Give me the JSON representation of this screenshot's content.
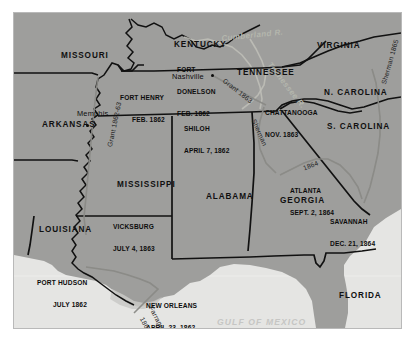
{
  "figure": {
    "kind": "historical-map",
    "frame_color": "#b9b9b9",
    "land_color": "#9e9e9c",
    "water_color": "#e3e3e1",
    "border_ink": "#111111"
  },
  "states": [
    {
      "name": "MISSOURI",
      "x": 47,
      "y": 38
    },
    {
      "name": "KENTUCKY",
      "x": 160,
      "y": 27
    },
    {
      "name": "VIRGINIA",
      "x": 303,
      "y": 28
    },
    {
      "name": "TENNESSEE",
      "x": 223,
      "y": 55
    },
    {
      "name": "N. CAROLINA",
      "x": 310,
      "y": 75
    },
    {
      "name": "S. CAROLINA",
      "x": 313,
      "y": 109
    },
    {
      "name": "ARKANSAS",
      "x": 28,
      "y": 107
    },
    {
      "name": "MISSISSIPPI",
      "x": 103,
      "y": 167
    },
    {
      "name": "ALABAMA",
      "x": 192,
      "y": 179
    },
    {
      "name": "GEORGIA",
      "x": 266,
      "y": 183
    },
    {
      "name": "LOUISIANA",
      "x": 25,
      "y": 212
    },
    {
      "name": "FLORIDA",
      "x": 325,
      "y": 278
    }
  ],
  "battles": [
    {
      "place": "FORT HENRY",
      "date": "FEB. 1862",
      "x": 106,
      "y": 69,
      "align": "left"
    },
    {
      "place": "FORT",
      "date": "FEB. 1862",
      "extra": "DONELSON",
      "x": 163,
      "y": 44,
      "align": "left"
    },
    {
      "place": "SHILOH",
      "date": "APRIL 7, 1862",
      "x": 170,
      "y": 100,
      "align": "left"
    },
    {
      "place": "CHATTANOOGA",
      "date": "NOV. 1863",
      "x": 253,
      "y": 84,
      "align": "left"
    },
    {
      "place": "ATLANTA",
      "date": "SEPT. 2, 1864",
      "x": 278,
      "y": 162,
      "align": "left"
    },
    {
      "place": "SAVANNAH",
      "date": "DEC. 21, 1864",
      "x": 318,
      "y": 193,
      "align": "left"
    },
    {
      "place": "VICKSBURG",
      "date": "JULY 4, 1863",
      "x": 101,
      "y": 198,
      "align": "left"
    },
    {
      "place": "PORT HUDSON",
      "date": "JULY 1862",
      "x": 25,
      "y": 254,
      "align": "left"
    },
    {
      "place": "NEW ORLEANS",
      "date": "APRIL 23, 1862",
      "x": 134,
      "y": 277,
      "align": "left"
    }
  ],
  "cities": [
    {
      "name": "Memphis",
      "x": 63,
      "y": 100,
      "dot_x": 72,
      "dot_y": 111
    },
    {
      "name": "Nashville",
      "x": 158,
      "y": 64,
      "dot_x": 197,
      "dot_y": 61
    }
  ],
  "routes": [
    {
      "label": "Grant 1862-63",
      "x": 92,
      "y": 133,
      "rotate": -78
    },
    {
      "label": "Grant 1863",
      "x": 214,
      "y": 66,
      "rotate": 38
    },
    {
      "label": "Sherman",
      "x": 243,
      "y": 107,
      "rotate": 66
    },
    {
      "label": "1864",
      "x": 288,
      "y": 154,
      "rotate": -22
    },
    {
      "label": "Sherman 1865",
      "x": 366,
      "y": 70,
      "rotate": -74
    },
    {
      "label": "Farragut",
      "x": 141,
      "y": 296,
      "rotate": 62
    },
    {
      "label": "1862",
      "x": 134,
      "y": 310,
      "rotate": 62
    }
  ],
  "water_labels": [
    {
      "label": "GULF OF MEXICO",
      "x": 203,
      "y": 311
    }
  ],
  "river_labels": [
    {
      "label": "Cumberland R.",
      "x": 207,
      "y": 22,
      "rotate": -6
    },
    {
      "label": "Tennessee R.",
      "x": 258,
      "y": 48,
      "rotate": 52
    }
  ]
}
